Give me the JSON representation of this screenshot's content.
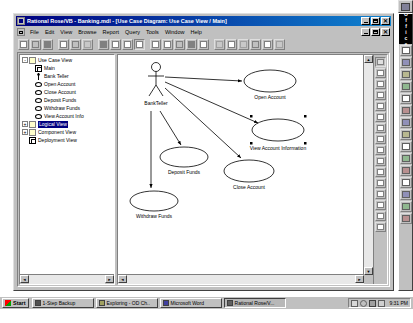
{
  "window": {
    "title": "Rational Rose/VB - Banking.mdl - [Use Case Diagram: Use Case View / Main]",
    "app_icon": "rose-app-icon",
    "controls": {
      "minimize": "_",
      "maximize": "□",
      "close": "✕"
    },
    "mdi_controls": {
      "minimize": "_",
      "restore": "□",
      "close": "✕"
    }
  },
  "menu": {
    "items": [
      {
        "label": "File"
      },
      {
        "label": "Edit"
      },
      {
        "label": "View"
      },
      {
        "label": "Browse"
      },
      {
        "label": "Report"
      },
      {
        "label": "Query"
      },
      {
        "label": "Tools"
      },
      {
        "label": "Window"
      },
      {
        "label": "Help"
      }
    ]
  },
  "toolbar": {
    "buttons": [
      {
        "name": "new-file-button",
        "tip": "New"
      },
      {
        "name": "open-file-button",
        "tip": "Open"
      },
      {
        "name": "save-file-button",
        "tip": "Save"
      },
      {
        "name": "cut-button",
        "tip": "Cut"
      },
      {
        "name": "copy-button",
        "tip": "Copy"
      },
      {
        "name": "paste-button",
        "tip": "Paste"
      },
      {
        "name": "print-button",
        "tip": "Print"
      },
      {
        "name": "context-help-button",
        "tip": "Context Sensitive Help"
      },
      {
        "name": "whats-this-button",
        "tip": "What's This"
      },
      {
        "name": "browse-class-button",
        "tip": "Browse Class Diagram"
      },
      {
        "name": "browse-usecase-button",
        "tip": "Browse Use Case Diagram"
      },
      {
        "name": "browse-component-button",
        "tip": "Browse Component Diagram"
      },
      {
        "name": "browse-state-button",
        "tip": "Browse State Diagram"
      },
      {
        "name": "browse-parent-button",
        "tip": "Browse Parent"
      },
      {
        "name": "browse-previous-button",
        "tip": "Browse Previous Diagram"
      },
      {
        "name": "zoom-in-button",
        "tip": "Zoom In"
      },
      {
        "name": "zoom-out-button",
        "tip": "Zoom Out"
      },
      {
        "name": "fit-in-window-button",
        "tip": "Fit In Window"
      },
      {
        "name": "undo-fit-button",
        "tip": "Undo Fit In Window"
      }
    ]
  },
  "browser": {
    "tree": [
      {
        "label": "Use Case View",
        "icon": "folder-icon",
        "expander": "-",
        "indent": 0,
        "selected": false
      },
      {
        "label": "Main",
        "icon": "diagram-icon",
        "expander": "",
        "indent": 1,
        "selected": false
      },
      {
        "label": "Bank Teller",
        "icon": "actor-icon",
        "expander": "",
        "indent": 1,
        "selected": false
      },
      {
        "label": "Open Account",
        "icon": "usecase-icon",
        "expander": "",
        "indent": 1,
        "selected": false
      },
      {
        "label": "Close Account",
        "icon": "usecase-icon",
        "expander": "",
        "indent": 1,
        "selected": false
      },
      {
        "label": "Deposit Funds",
        "icon": "usecase-icon",
        "expander": "",
        "indent": 1,
        "selected": false
      },
      {
        "label": "Withdraw Funds",
        "icon": "usecase-icon",
        "expander": "",
        "indent": 1,
        "selected": false
      },
      {
        "label": "View Account Info",
        "icon": "usecase-icon",
        "expander": "",
        "indent": 1,
        "selected": false
      },
      {
        "label": "Logical View",
        "icon": "folder-icon",
        "expander": "+",
        "indent": 0,
        "selected": true
      },
      {
        "label": "Component View",
        "icon": "folder-icon",
        "expander": "+",
        "indent": 0,
        "selected": false
      },
      {
        "label": "Deployment View",
        "icon": "diagram-icon",
        "expander": "",
        "indent": 0,
        "selected": false
      }
    ]
  },
  "diagram": {
    "type": "Use Case Diagram",
    "actor": {
      "name": "BankTeller",
      "x": 38,
      "y": 14
    },
    "use_cases": [
      {
        "name": "Open Account",
        "cx": 152,
        "cy": 26,
        "rx": 25,
        "ry": 11,
        "selected": false
      },
      {
        "name": "View Account Information",
        "cx": 160,
        "cy": 75,
        "rx": 25,
        "ry": 11,
        "selected": true
      },
      {
        "name": "Deposit Funds",
        "cx": 66,
        "cy": 102,
        "rx": 23,
        "ry": 10,
        "selected": false
      },
      {
        "name": "Close Account",
        "cx": 131,
        "cy": 115,
        "rx": 24,
        "ry": 11,
        "selected": false
      },
      {
        "name": "Withdraw Funds",
        "cx": 38,
        "cy": 145,
        "rx": 23,
        "ry": 10,
        "selected": false
      }
    ],
    "associations": [
      {
        "from": "BankTeller",
        "to": "Open Account"
      },
      {
        "from": "BankTeller",
        "to": "View Account Information"
      },
      {
        "from": "BankTeller",
        "to": "Deposit Funds"
      },
      {
        "from": "BankTeller",
        "to": "Close Account"
      },
      {
        "from": "BankTeller",
        "to": "Withdraw Funds"
      }
    ]
  },
  "tool_palette": {
    "tools": [
      {
        "name": "selection-tool",
        "label": "Selection Arrow",
        "selected": true
      },
      {
        "name": "text-box-tool",
        "label": "Text Box",
        "selected": false
      },
      {
        "name": "note-tool",
        "label": "Note",
        "selected": false
      },
      {
        "name": "anchor-note-tool",
        "label": "Anchor Note to Item",
        "selected": false
      },
      {
        "name": "package-tool",
        "label": "Package",
        "selected": false
      },
      {
        "name": "usecase-tool",
        "label": "Use Case",
        "selected": false
      },
      {
        "name": "actor-tool",
        "label": "Actor",
        "selected": false
      },
      {
        "name": "unidir-assoc-tool",
        "label": "Unidirectional Association",
        "selected": false
      },
      {
        "name": "dependency-tool",
        "label": "Dependency",
        "selected": false
      },
      {
        "name": "generalization-tool",
        "label": "Generalization",
        "selected": false
      },
      {
        "name": "class-tool",
        "label": "Class",
        "selected": false
      },
      {
        "name": "interface-tool",
        "label": "Interface",
        "selected": false
      },
      {
        "name": "realize-tool",
        "label": "Realize",
        "selected": false
      },
      {
        "name": "component-tool",
        "label": "Component",
        "selected": false
      },
      {
        "name": "node-tool",
        "label": "Node",
        "selected": false
      },
      {
        "name": "state-tool",
        "label": "State",
        "selected": false
      }
    ]
  },
  "office_bar": {
    "title": "Office",
    "buttons": [
      {
        "name": "new-office-document-button",
        "label": "New Office Document"
      },
      {
        "name": "open-office-document-button",
        "label": "Open Office Document"
      },
      {
        "name": "new-message-button",
        "label": "New Message"
      },
      {
        "name": "new-appointment-button",
        "label": "New Appointment"
      },
      {
        "name": "new-task-button",
        "label": "New Task"
      },
      {
        "name": "new-contact-button",
        "label": "New Contact"
      },
      {
        "name": "new-journal-button",
        "label": "New Journal Entry"
      },
      {
        "name": "new-note-button",
        "label": "New Note"
      },
      {
        "name": "microsoft-outlook-button",
        "label": "Microsoft Outlook"
      },
      {
        "name": "getting-results-button",
        "label": "Getting Results Book"
      },
      {
        "name": "microsoft-bookshelf-button",
        "label": "Microsoft Bookshelf Basics"
      },
      {
        "name": "answer-wizard-button",
        "label": "Answer Wizard"
      },
      {
        "name": "word-button",
        "label": "Microsoft Word"
      },
      {
        "name": "excel-button",
        "label": "Microsoft Excel"
      },
      {
        "name": "powerpoint-button",
        "label": "Microsoft PowerPoint"
      }
    ]
  },
  "taskbar": {
    "start": {
      "label": "Start",
      "icon": "windows-flag-icon"
    },
    "tasks": [
      {
        "label": "1-Step Backup",
        "icon": "backup-icon",
        "active": false
      },
      {
        "label": "Exploring - OD Ch..",
        "icon": "explorer-icon",
        "active": false
      },
      {
        "label": "Microsoft Word",
        "icon": "word-icon",
        "active": false
      },
      {
        "label": "Rational Rose/V...",
        "icon": "rose-icon",
        "active": true
      }
    ],
    "tray": {
      "icons": [
        {
          "name": "printer-tray-icon"
        },
        {
          "name": "volume-tray-icon"
        },
        {
          "name": "network-tray-icon"
        },
        {
          "name": "misc-tray-icon"
        }
      ],
      "clock": "9:31 PM"
    }
  }
}
